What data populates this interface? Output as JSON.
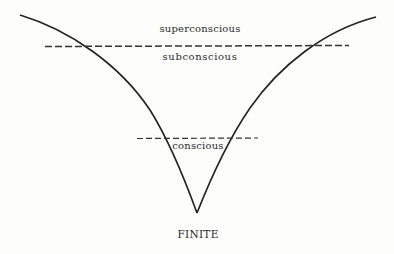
{
  "diagram": {
    "type": "consciousness-levels-cone",
    "labels": {
      "superconscious": "superconscious",
      "subconscious": "subconscious",
      "conscious": "conscious",
      "apex": "FINITE"
    },
    "colors": {
      "line": "#222222",
      "text": "#2a2a2a",
      "background": "#fdfdfc"
    },
    "shapes": {
      "left_curve": {
        "from": [
          20,
          15
        ],
        "to": [
          197,
          213
        ]
      },
      "right_curve": {
        "from": [
          197,
          213
        ],
        "to": [
          376,
          17
        ]
      },
      "upper_dashed_line": {
        "x1": 45,
        "x2": 349,
        "y": 46
      },
      "lower_dashed_line": {
        "x1": 137,
        "x2": 258,
        "y": 138
      }
    }
  }
}
